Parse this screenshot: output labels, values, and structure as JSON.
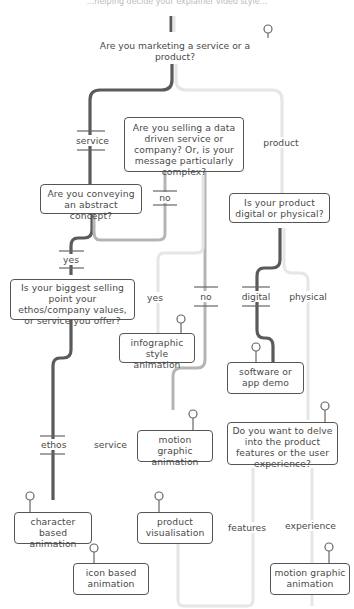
{
  "top_text": "...helping decide your explainer video style...",
  "questions": {
    "q1": "Are you marketing a service or a product?",
    "q2": "Are you selling a data driven service or company? Or, is your message particularly complex?",
    "q3": "Are you conveying an abstract concept?",
    "q4": "Is your biggest selling point your ethos/company values, or service you offer?",
    "q5": "Is your product digital or physical?",
    "q6": "Do you want to delve into the product features or the user experience?"
  },
  "labels": {
    "service": "service",
    "product": "product",
    "no1": "no",
    "yes1": "yes",
    "yes2": "yes",
    "no2": "no",
    "digital": "digital",
    "physical": "physical",
    "ethos": "ethos",
    "service2": "service",
    "features": "features",
    "experience": "experience"
  },
  "outcomes": {
    "infographic": "infographic style animation",
    "software": "software or app demo",
    "motion1": "motion graphic animation",
    "character": "character based animation",
    "product_vis": "product visualisation",
    "icon": "icon based animation",
    "motion2": "motion graphic animation"
  },
  "colors": {
    "dark": "#5a5a5a",
    "mid": "#b5b5b5",
    "light": "#e6e6e6"
  }
}
